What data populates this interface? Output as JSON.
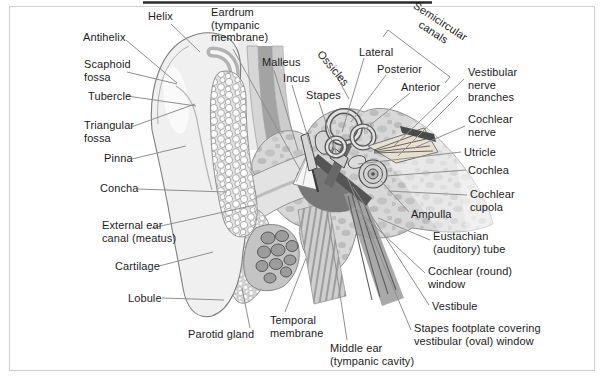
{
  "figure": {
    "type": "anatomical-diagram",
    "labels": {
      "helix": "Helix",
      "antihelix": "Antihelix",
      "scaphoid_fossa": "Scaphoid fossa",
      "tubercle": "Tubercle",
      "triangular_fossa": "Triangular fossa",
      "pinna": "Pinna",
      "concha": "Concha",
      "external_ear_canal": "External ear canal (meatus)",
      "cartilage": "Cartilage",
      "lobule": "Lobule",
      "parotid_gland": "Parotid gland",
      "temporal_membrane": "Temporal membrane",
      "middle_ear": "Middle ear (tympanic cavity)",
      "eardrum": "Eardrum (tympanic membrane)",
      "malleus": "Malleus",
      "incus": "Incus",
      "stapes": "Stapes",
      "ossicles": "Ossicles",
      "semicircular_canals": "Semicircular canals",
      "lateral": "Lateral",
      "posterior": "Posterior",
      "anterior": "Anterior",
      "vestibular_nerve_branches": "Vestibular nerve branches",
      "cochlear_nerve": "Cochlear nerve",
      "utricle": "Utricle",
      "cochlea": "Cochlea",
      "cochlear_cupola": "Cochlear cupola",
      "ampulla": "Ampulla",
      "eustachian_tube": "Eustachian (auditory) tube",
      "cochlear_round_window": "Cochlear (round) window",
      "vestibule": "Vestibule",
      "stapes_footplate": "Stapes footplate covering vestibular (oval) window"
    },
    "palette": {
      "background": "#ffffff",
      "text": "#1c1c1c",
      "leader_line": "#8f8f8f",
      "bone_fill": "#d8d8d8",
      "middle_ear_cavity": "#777777",
      "nerve_fill": "#e7dfcf",
      "frame_line": "#cfcfcf"
    }
  }
}
